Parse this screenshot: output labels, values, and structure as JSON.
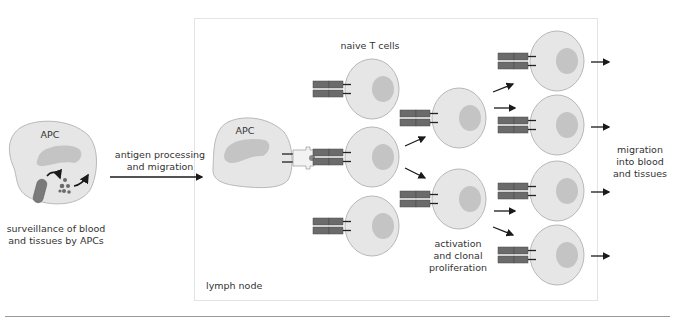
{
  "diagram": {
    "left_apc": {
      "label": "APC",
      "caption": "surveillance of blood\nand tissues by APCs"
    },
    "step1_label": "antigen processing\nand migration",
    "lymph_node": {
      "label": "lymph node",
      "apc_label": "APC",
      "naive_label": "naive T cells",
      "activation_label": "activation\nand clonal\nproliferation"
    },
    "exit_label": "migration\ninto blood\nand tissues"
  },
  "colors": {
    "cell_fill": "#e6e6e6",
    "cell_stroke": "#b8b8b8",
    "nucleus": "#c4c4c4",
    "receptor": "#6b6b6b",
    "arrow": "#1a1a1a",
    "box_border": "#e4e4e4",
    "rule": "#9a9a9a"
  }
}
